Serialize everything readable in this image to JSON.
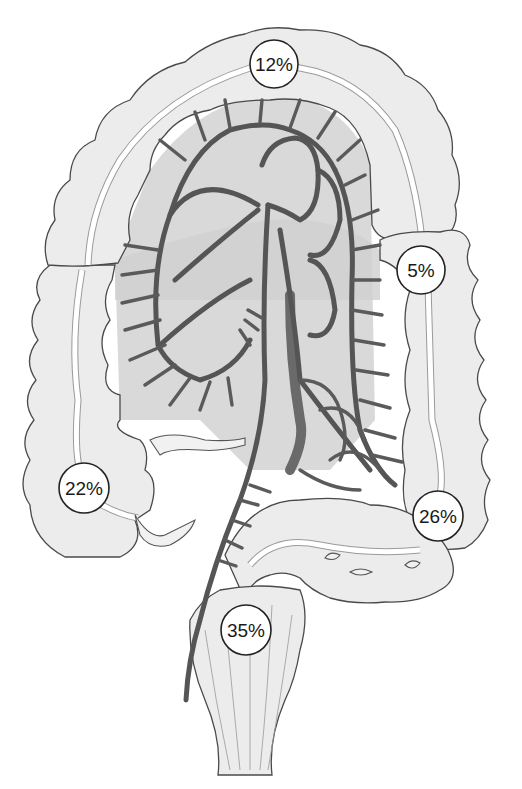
{
  "diagram": {
    "labels": [
      {
        "id": "transverse",
        "text": "12%",
        "cx": 274,
        "cy": 64
      },
      {
        "id": "descending-upper",
        "text": "5%",
        "cx": 421,
        "cy": 270
      },
      {
        "id": "ascending-cecum",
        "text": "22%",
        "cx": 84,
        "cy": 488
      },
      {
        "id": "sigmoid-descending",
        "text": "26%",
        "cx": 438,
        "cy": 516
      },
      {
        "id": "rectosigmoid",
        "text": "35%",
        "cx": 246,
        "cy": 630
      }
    ],
    "colors": {
      "background": "#ffffff",
      "bowel_fill": "#ececec",
      "outline": "#4a4a4a",
      "vessel": "#555555",
      "label_fill": "#ffffff",
      "label_stroke": "#222222"
    }
  }
}
